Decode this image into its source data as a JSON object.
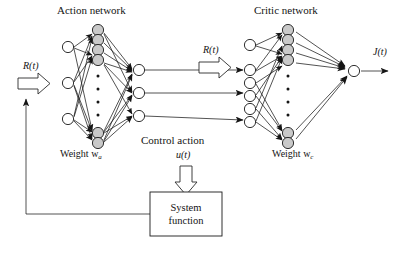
{
  "diagram": {
    "type": "block-diagram",
    "labels": {
      "action_network": "Action network",
      "critic_network": "Critic network",
      "weight_action": "Weight w",
      "weight_action_sub": "a",
      "weight_critic": "Weight w",
      "weight_critic_sub": "c",
      "reward_input_left": "R(t)",
      "reward_input_right": "R(t)",
      "control_action": "Control action",
      "control_action_signal": "u(t)",
      "output_signal": "J(t)",
      "system_box_line1": "System",
      "system_box_line2": "function"
    },
    "nodes": {
      "action_input_count": 3,
      "action_hidden_top_count": 4,
      "action_hidden_bottom_count": 2,
      "action_hidden_ellipsis": 4,
      "action_output_count": 3,
      "critic_input_count": 6,
      "critic_hidden_top_count": 4,
      "critic_hidden_bottom_count": 2,
      "critic_hidden_ellipsis": 4,
      "critic_output_count": 1
    },
    "colors": {
      "hidden_node_fill": "#c9c9c9",
      "io_node_fill": "#ffffff",
      "stroke": "#1a1a1a",
      "background": "#ffffff",
      "arrow_outline_fill": "#ffffff"
    },
    "blocks": [
      {
        "name": "system-function",
        "x": 150,
        "y": 192,
        "w": 72,
        "h": 44
      }
    ],
    "flow": [
      "R(t) -> action network",
      "action network -> control action u(t)",
      "control action u(t) -> system function",
      "system function -> feedback to R(t)",
      "R(t) -> critic network",
      "action outputs -> critic inputs",
      "critic network -> J(t)"
    ]
  }
}
